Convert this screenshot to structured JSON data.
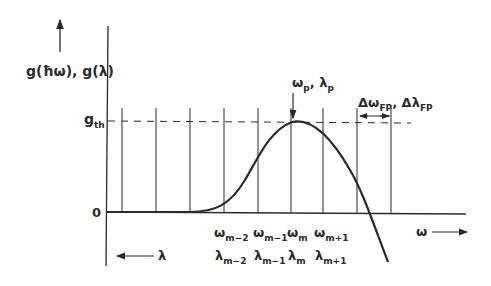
{
  "y_axis": {
    "label": "g(ħω), g(λ)",
    "threshold_label": "g",
    "threshold_sub": "th",
    "zero_label": "0"
  },
  "peak": {
    "label_a": "ω",
    "sub_a": "p",
    "sep": ", ",
    "label_b": "λ",
    "sub_b": "p"
  },
  "spacing": {
    "label_a": "Δω",
    "sub_a": "FP",
    "sep": ", ",
    "label_b": "Δλ",
    "sub_b": "FP"
  },
  "omega_modes": [
    {
      "sym": "ω",
      "sub": "m−2"
    },
    {
      "sym": "ω",
      "sub": "m−1"
    },
    {
      "sym": "ω",
      "sub": "m"
    },
    {
      "sym": "ω",
      "sub": "m+1"
    }
  ],
  "lambda_modes": [
    {
      "sym": "λ",
      "sub": "m−2"
    },
    {
      "sym": "λ",
      "sub": "m−1"
    },
    {
      "sym": "λ",
      "sub": "m"
    },
    {
      "sym": "λ",
      "sub": "m+1"
    }
  ],
  "x_axis": {
    "omega_label": "ω",
    "lambda_label": "λ"
  },
  "colors": {
    "ink": "#2a2a2a",
    "background": "#ffffff"
  }
}
